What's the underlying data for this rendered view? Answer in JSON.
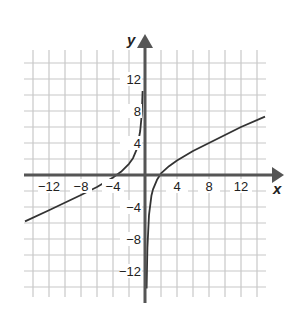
{
  "chart_data": {
    "type": "line",
    "title": "",
    "xlabel": "x",
    "ylabel": "y",
    "xlim": [
      -15,
      15
    ],
    "ylim": [
      -15,
      15.5
    ],
    "grid": true,
    "grid_step": 2,
    "x_ticks": [
      -12,
      -8,
      -4,
      4,
      8,
      12
    ],
    "y_ticks": [
      12,
      8,
      4,
      -4,
      -8,
      -12
    ],
    "x_tick_labels": [
      "−12",
      "−8",
      "−4",
      "4",
      "8",
      "12"
    ],
    "y_tick_labels": [
      "12",
      "8",
      "4",
      "−4",
      "−8",
      "−12"
    ],
    "vertical_asymptote": 0,
    "series": [
      {
        "name": "left branch",
        "x": [
          -15,
          -12,
          -8,
          -6,
          -4,
          -3,
          -2,
          -1.5,
          -1,
          -0.6,
          -0.4,
          -0.3
        ],
        "y": [
          -5.8,
          -4.4,
          -2.5,
          -1.5,
          -0.3,
          0.4,
          1.4,
          2.1,
          3.3,
          5.5,
          7.6,
          10.5
        ]
      },
      {
        "name": "right branch",
        "x": [
          0.2,
          0.3,
          0.5,
          0.8,
          1,
          1.5,
          2,
          3,
          4,
          6,
          8,
          12,
          15
        ],
        "y": [
          -14.2,
          -9.1,
          -5.0,
          -2.6,
          -1.8,
          -0.6,
          0.2,
          1.1,
          1.8,
          3.0,
          4.0,
          6.0,
          7.3
        ]
      }
    ]
  },
  "colors": {
    "grid": "#c8c8c8",
    "axis": "#555555",
    "curve": "#333333",
    "text": "#222222"
  }
}
